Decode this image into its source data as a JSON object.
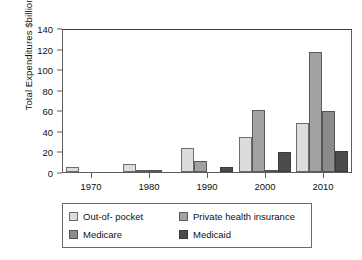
{
  "chart_data": {
    "type": "bar",
    "title": "",
    "xlabel": "",
    "ylabel": "Total Expenditures $billions",
    "categories": [
      "1970",
      "1980",
      "1990",
      "2000",
      "2010"
    ],
    "series": [
      {
        "name": "Out-of- pocket",
        "color": "#dcdcdc",
        "values": [
          5,
          8,
          23,
          34,
          48
        ]
      },
      {
        "name": "Private health insurance",
        "color": "#a2a2a2",
        "values": [
          0,
          1.5,
          11,
          60,
          117
        ]
      },
      {
        "name": "Medicare",
        "color": "#8b8b8b",
        "values": [
          0,
          1,
          0,
          2,
          59
        ]
      },
      {
        "name": "Medicaid",
        "color": "#4b4b4b",
        "values": [
          0,
          0,
          5,
          19,
          20
        ]
      }
    ],
    "ylim": [
      0,
      140
    ],
    "yticks": [
      0,
      20,
      40,
      60,
      80,
      100,
      120,
      140
    ],
    "ytick_labels": [
      "0",
      "20",
      "40",
      "60",
      "80",
      "100",
      "120",
      "140"
    ],
    "grid": false,
    "legend_position": "bottom"
  },
  "legend": {
    "entries": [
      {
        "label": "Out-of- pocket",
        "swatch": "s0"
      },
      {
        "label": "Private health insurance",
        "swatch": "s1"
      },
      {
        "label": "Medicare",
        "swatch": "s2"
      },
      {
        "label": "Medicaid",
        "swatch": "s3"
      }
    ]
  }
}
